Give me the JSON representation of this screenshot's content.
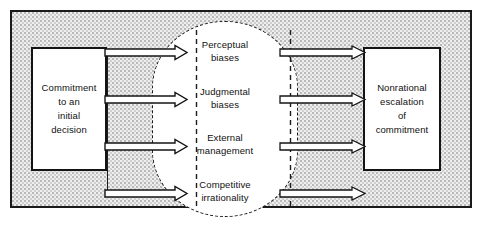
{
  "figure": {
    "background_color": "#eeeeee",
    "line_color": "#141414"
  },
  "input_box": {
    "label": "Commitment\nto an\ninitial\ndecision"
  },
  "output_box": {
    "label": "Nonrational\nescalation\nof\ncommitment"
  },
  "factors": [
    {
      "label": "Perceptual\nbiases"
    },
    {
      "label": "Judgmental\nbiases"
    },
    {
      "label": "External\nmanagement"
    },
    {
      "label": "Competitive\nirrationality"
    }
  ],
  "arrows": {
    "inbound_count": 4,
    "outbound_count": 4,
    "style": "hollow-outline"
  }
}
